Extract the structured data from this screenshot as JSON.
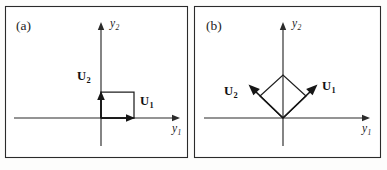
{
  "figure": {
    "background_color": "#fdfdfc",
    "ink_color": "#1d1d1d",
    "panels": [
      {
        "tag": "(a)",
        "tag_x": 16,
        "tag_y": 30,
        "frame": {
          "x": 5.5,
          "y": 6.5,
          "w": 182,
          "h": 151
        },
        "origin": {
          "x": 101,
          "y": 118
        },
        "x_axis": {
          "x1": 14,
          "y1": 118,
          "x2": 180,
          "y2": 118
        },
        "y_axis": {
          "x1": 101,
          "y1": 22,
          "x2": 101,
          "y2": 146
        },
        "x_axis_label": {
          "base": "y",
          "sub": "1",
          "x": 172,
          "y": 132
        },
        "y_axis_label": {
          "base": "y",
          "sub": "2",
          "x": 110,
          "y": 27
        },
        "shape": {
          "type": "square",
          "points": "101,118 134,118 134,92 101,92"
        },
        "vectors": [
          {
            "name": "U1",
            "base": "U",
            "sub": "1",
            "from": {
              "x": 101,
              "y": 118
            },
            "to": {
              "x": 134,
              "y": 118
            },
            "label_x": 140,
            "label_y": 105
          },
          {
            "name": "U2",
            "base": "U",
            "sub": "2",
            "from": {
              "x": 101,
              "y": 118
            },
            "to": {
              "x": 101,
              "y": 92
            },
            "label_x": 77,
            "label_y": 80
          }
        ]
      },
      {
        "tag": "(b)",
        "tag_x": 206,
        "tag_y": 30,
        "frame": {
          "x": 194.5,
          "y": 6.5,
          "w": 186,
          "h": 151
        },
        "origin": {
          "x": 283,
          "y": 118
        },
        "x_axis": {
          "x1": 204,
          "y1": 118,
          "x2": 370,
          "y2": 118
        },
        "y_axis": {
          "x1": 283,
          "y1": 22,
          "x2": 283,
          "y2": 146
        },
        "x_axis_label": {
          "base": "y",
          "sub": "1",
          "x": 362,
          "y": 132
        },
        "y_axis_label": {
          "base": "y",
          "sub": "2",
          "x": 292,
          "y": 27
        },
        "shape": {
          "type": "rhombus",
          "points": "283,118 260,96 283,75 306,96"
        },
        "vectors": [
          {
            "name": "U1",
            "base": "U",
            "sub": "1",
            "from": {
              "x": 283,
              "y": 118
            },
            "to": {
              "x": 316,
              "y": 86
            },
            "label_x": 322,
            "label_y": 90
          },
          {
            "name": "U2",
            "base": "U",
            "sub": "2",
            "from": {
              "x": 283,
              "y": 118
            },
            "to": {
              "x": 250,
              "y": 86
            },
            "label_x": 224,
            "label_y": 95
          }
        ]
      }
    ]
  }
}
